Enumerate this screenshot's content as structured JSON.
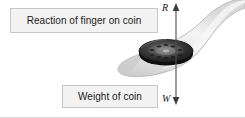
{
  "figure": {
    "background_color": "#ffffff",
    "width": 245,
    "height": 118
  },
  "labels": {
    "reaction": {
      "text": "Reaction of finger on coin",
      "fill_color": "#f2f2f2",
      "border_color": "#c6c6c6"
    },
    "weight": {
      "text": "Weight of coin",
      "fill_color": "#f2f2f2",
      "border_color": "#c6c6c6"
    }
  },
  "forces": {
    "upward": {
      "symbol": "R",
      "name": "reaction-force",
      "direction": "up",
      "color": "#4d4d4d"
    },
    "downward": {
      "symbol": "W",
      "name": "weight-force",
      "direction": "down",
      "color": "#4d4d4d"
    }
  },
  "illustration": {
    "coin": {
      "name": "coin",
      "color": "#2e2e2e",
      "rim_color": "#141414",
      "face_color": "#6b6b6b"
    },
    "finger": {
      "name": "finger",
      "color": "#e3e3e3",
      "shade_color": "#bdbdbd",
      "outline_color": "#9e9e9e"
    }
  }
}
